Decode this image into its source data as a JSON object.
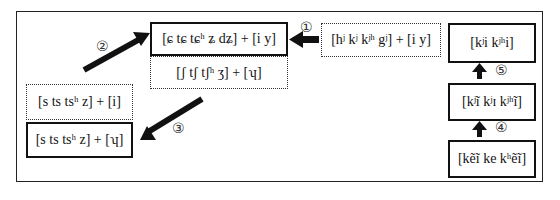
{
  "diagram": {
    "title": "",
    "boxes": {
      "palatal": {
        "text": "[ɕ tɕ tɕʰ ʑ dʑ] + [i y]",
        "style": "solid"
      },
      "postalveolar": {
        "text": "[ʃ tʃ tʃʰ ʒ] + [ʮ]",
        "style": "dotted"
      },
      "velar_palatalized": {
        "text": "[hʲ kʲ kʲʰ gʲ] + [i y]",
        "style": "dotted"
      },
      "stage_top": {
        "text": "[kʲi kʲʰi]",
        "style": "solid"
      },
      "stage_mid": {
        "text": "[kʲĩ kʲɪ kʲʰĩ]",
        "style": "solid"
      },
      "stage_bottom": {
        "text": "[kẽĩ ke kʰẽĩ]",
        "style": "solid"
      },
      "dental_i": {
        "text": "[s ts tsʰ z] + [i]",
        "style": "dotted"
      },
      "dental_apical": {
        "text": "[s ts tsʰ z] + [ʮ]",
        "style": "solid"
      }
    },
    "arrows": [
      {
        "label": "①",
        "from": "velar_palatalized",
        "to": "palatal",
        "direction": "left"
      },
      {
        "label": "②",
        "from": "dental_i",
        "to": "palatal",
        "direction": "up-right"
      },
      {
        "label": "③",
        "from": "postalveolar",
        "to": "dental_apical",
        "direction": "down-left"
      },
      {
        "label": "④",
        "from": "stage_bottom",
        "to": "stage_mid",
        "direction": "up"
      },
      {
        "label": "⑤",
        "from": "stage_mid",
        "to": "stage_top",
        "direction": "up"
      }
    ]
  }
}
